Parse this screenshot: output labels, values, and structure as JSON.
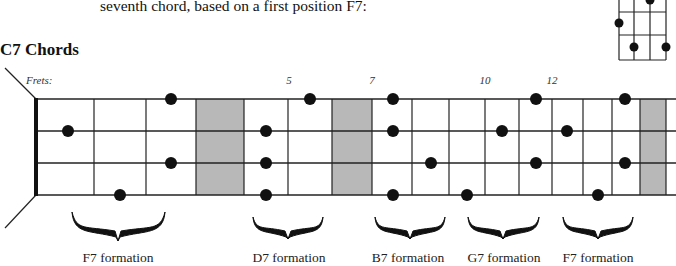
{
  "intro_text": "seventh chord, based on a first position F7:",
  "section_title": "C7 Chords",
  "frets_label": "Frets:",
  "fret_markers": [
    {
      "label": "5",
      "x": 289
    },
    {
      "label": "7",
      "x": 372
    },
    {
      "label": "10",
      "x": 485
    },
    {
      "label": "12",
      "x": 552
    }
  ],
  "fretboard": {
    "nut_x": 36,
    "end_x": 676,
    "strings_y": [
      99,
      131,
      163,
      195
    ],
    "fret_lines_x": [
      94,
      146,
      196,
      244,
      288,
      332,
      372,
      412,
      449,
      485,
      519,
      552,
      583,
      612,
      640,
      666
    ],
    "shaded_regions": [
      {
        "x1": 196,
        "x2": 244
      },
      {
        "x1": 332,
        "x2": 372
      },
      {
        "x1": 640,
        "x2": 666
      }
    ],
    "colors": {
      "line": "#222222",
      "shade": "#b8b8b8",
      "dot": "#111111"
    },
    "dots": [
      {
        "string": 0,
        "x": 171
      },
      {
        "string": 0,
        "x": 310
      },
      {
        "string": 0,
        "x": 393
      },
      {
        "string": 0,
        "x": 536
      },
      {
        "string": 0,
        "x": 625
      },
      {
        "string": 1,
        "x": 68
      },
      {
        "string": 1,
        "x": 266
      },
      {
        "string": 1,
        "x": 393
      },
      {
        "string": 1,
        "x": 502
      },
      {
        "string": 1,
        "x": 567
      },
      {
        "string": 2,
        "x": 171
      },
      {
        "string": 2,
        "x": 266
      },
      {
        "string": 2,
        "x": 431
      },
      {
        "string": 2,
        "x": 536
      },
      {
        "string": 2,
        "x": 625
      },
      {
        "string": 3,
        "x": 120
      },
      {
        "string": 3,
        "x": 266
      },
      {
        "string": 3,
        "x": 393
      },
      {
        "string": 3,
        "x": 467
      },
      {
        "string": 3,
        "x": 598
      }
    ]
  },
  "formations": [
    {
      "label": "F7 formation",
      "x1": 72,
      "x2": 165,
      "tip": 118,
      "label_x": 118
    },
    {
      "label": "D7 formation",
      "x1": 253,
      "x2": 323,
      "tip": 288,
      "label_x": 289
    },
    {
      "label": "B7 formation",
      "x1": 375,
      "x2": 445,
      "tip": 410,
      "label_x": 408
    },
    {
      "label": "G7 formation",
      "x1": 468,
      "x2": 539,
      "tip": 503,
      "label_x": 504
    },
    {
      "label": "F7 formation",
      "x1": 563,
      "x2": 633,
      "tip": 598,
      "label_x": 598
    }
  ],
  "mini_chord": {
    "grid_x": [
      619,
      634,
      650,
      666
    ],
    "grid_y": [
      -10,
      12,
      35,
      60
    ],
    "dots": [
      {
        "x": 650,
        "y": 0
      },
      {
        "x": 619,
        "y": 23
      },
      {
        "x": 634,
        "y": 47
      },
      {
        "x": 666,
        "y": 47
      }
    ]
  }
}
